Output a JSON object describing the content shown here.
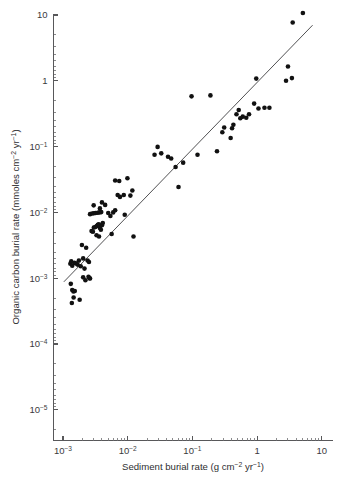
{
  "chart_data": {
    "type": "scatter",
    "title": "",
    "xlabel": "Sediment burial rate (g cm−2 yr−1)",
    "ylabel": "Organic carbon burial rate (mmoles cm−2 yr−1)",
    "xscale": "log",
    "yscale": "log",
    "xlim": [
      0.00063,
      10
    ],
    "ylim": [
      3.2e-06,
      10
    ],
    "grid": false,
    "legend": null,
    "xtick_values": [
      0.001,
      0.01,
      0.1,
      1,
      10
    ],
    "xtick_labels": [
      "10−3",
      "10−2",
      "10−1",
      "1",
      "10"
    ],
    "ytick_values": [
      1e-05,
      0.0001,
      0.001,
      0.01,
      0.1,
      1,
      10
    ],
    "ytick_labels": [
      "10−5",
      "10−4",
      "10−3",
      "10−2",
      "10−1",
      "1",
      "10"
    ],
    "marker": {
      "shape": "circle",
      "color": "#111111",
      "size_px": 4.6
    },
    "fit_line": {
      "type": "power-law regression",
      "color": "#3d3d3f",
      "x_start": 0.00103,
      "y_start": 0.00088,
      "x_end": 7.2,
      "y_end": 7.0
    },
    "series": [
      {
        "name": "Sediment cores",
        "points": [
          [
            0.0013,
            0.00166
          ],
          [
            0.00134,
            0.0018
          ],
          [
            0.00139,
            0.00155
          ],
          [
            0.0015,
            0.00172
          ],
          [
            0.00158,
            0.00168
          ],
          [
            0.00168,
            0.00161
          ],
          [
            0.00176,
            0.00185
          ],
          [
            0.00188,
            0.00152
          ],
          [
            0.00205,
            0.002
          ],
          [
            0.00215,
            0.0014
          ],
          [
            0.0024,
            0.00186
          ],
          [
            0.00252,
            0.00176
          ],
          [
            0.00132,
            0.00082
          ],
          [
            0.00139,
            0.00066
          ],
          [
            0.00145,
            0.00063
          ],
          [
            0.00152,
            0.00064
          ],
          [
            0.00146,
            0.00051
          ],
          [
            0.00137,
            0.00042
          ],
          [
            0.00181,
            0.00047
          ],
          [
            0.00205,
            0.00103
          ],
          [
            0.00222,
            0.00093
          ],
          [
            0.00248,
            0.00105
          ],
          [
            0.00257,
            0.001
          ],
          [
            0.00262,
            0.00099
          ],
          [
            0.00196,
            0.0032
          ],
          [
            0.00228,
            0.0029
          ],
          [
            0.00276,
            0.0052
          ],
          [
            0.0029,
            0.0051
          ],
          [
            0.003,
            0.0059
          ],
          [
            0.00316,
            0.006
          ],
          [
            0.00332,
            0.0062
          ],
          [
            0.00345,
            0.0065
          ],
          [
            0.00358,
            0.0066
          ],
          [
            0.00372,
            0.0058
          ],
          [
            0.00385,
            0.00545
          ],
          [
            0.004,
            0.0064
          ],
          [
            0.00412,
            0.0069
          ],
          [
            0.0033,
            0.0045
          ],
          [
            0.0036,
            0.0043
          ],
          [
            0.00262,
            0.0094
          ],
          [
            0.00282,
            0.0096
          ],
          [
            0.003,
            0.0097
          ],
          [
            0.00318,
            0.0098
          ],
          [
            0.00344,
            0.0099
          ],
          [
            0.00366,
            0.01
          ],
          [
            0.0039,
            0.0101
          ],
          [
            0.00298,
            0.0128
          ],
          [
            0.00372,
            0.0115
          ],
          [
            0.004,
            0.0142
          ],
          [
            0.00448,
            0.013
          ],
          [
            0.005,
            0.0098
          ],
          [
            0.0054,
            0.0088
          ],
          [
            0.00565,
            0.0047
          ],
          [
            0.00596,
            0.01
          ],
          [
            0.0064,
            0.0108
          ],
          [
            0.007,
            0.0184
          ],
          [
            0.0076,
            0.0172
          ],
          [
            0.0064,
            0.0305
          ],
          [
            0.0074,
            0.03
          ],
          [
            0.0087,
            0.0184
          ],
          [
            0.009,
            0.0092
          ],
          [
            0.0099,
            0.033
          ],
          [
            0.011,
            0.018
          ],
          [
            0.0118,
            0.0215
          ],
          [
            0.0123,
            0.0043
          ],
          [
            0.026,
            0.075
          ],
          [
            0.029,
            0.099
          ],
          [
            0.033,
            0.079
          ],
          [
            0.042,
            0.07
          ],
          [
            0.047,
            0.066
          ],
          [
            0.055,
            0.049
          ],
          [
            0.061,
            0.0243
          ],
          [
            0.072,
            0.057
          ],
          [
            0.097,
            0.58
          ],
          [
            0.12,
            0.075
          ],
          [
            0.19,
            0.6
          ],
          [
            0.24,
            0.085
          ],
          [
            0.29,
            0.165
          ],
          [
            0.31,
            0.195
          ],
          [
            0.39,
            0.135
          ],
          [
            0.41,
            0.19
          ],
          [
            0.43,
            0.215
          ],
          [
            0.48,
            0.31
          ],
          [
            0.52,
            0.36
          ],
          [
            0.55,
            0.27
          ],
          [
            0.6,
            0.285
          ],
          [
            0.68,
            0.275
          ],
          [
            0.75,
            0.31
          ],
          [
            0.9,
            0.45
          ],
          [
            0.97,
            1.08
          ],
          [
            1.05,
            0.38
          ],
          [
            1.3,
            0.39
          ],
          [
            1.55,
            0.39
          ],
          [
            2.8,
            1.0
          ],
          [
            3.0,
            1.65
          ],
          [
            3.45,
            1.1
          ],
          [
            3.55,
            7.7
          ],
          [
            5.1,
            10.7
          ]
        ]
      }
    ]
  },
  "axes": {
    "x_title": "Sediment burial rate (g cm−2 yr−1)",
    "y_title": "Organic carbon burial rate (mmoles cm−2 yr−1)",
    "x_title_parts": {
      "pre": "Sediment burial rate (g cm",
      "sup1": "−2",
      "mid": " yr",
      "sup2": "−1",
      "post": ")"
    },
    "y_title_parts": {
      "pre": "Organic carbon burial rate (mmoles cm",
      "sup1": "−2",
      "mid": " yr",
      "sup2": "−1",
      "post": ")"
    }
  },
  "colors": {
    "marker": "#111111",
    "line": "#3d3d3f",
    "axis": "#58585a",
    "text": "#2e2e30",
    "background": "#ffffff"
  }
}
